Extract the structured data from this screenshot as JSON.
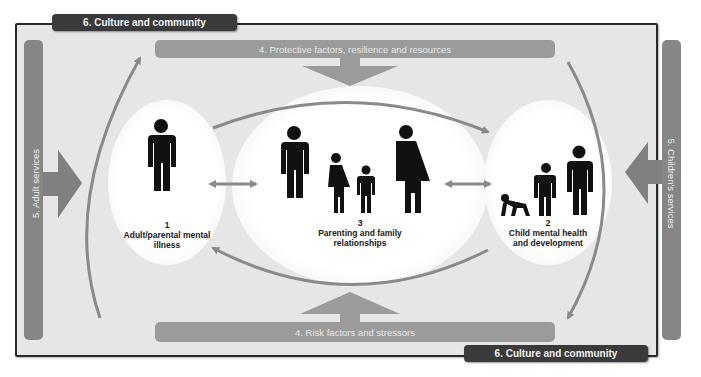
{
  "diagram": {
    "colors": {
      "frame_border": "#2a2a2a",
      "background": "#e6e6e6",
      "dark_label": "#3a3a3a",
      "bar_grey": "#9b9b9b",
      "side_bar_grey": "#868686",
      "arrow_grey": "#8a8a8a",
      "figure": "#111111"
    },
    "culture_top": {
      "label": "6. Culture and community"
    },
    "culture_bottom": {
      "label": "6. Culture and community"
    },
    "protective_bar": {
      "label": "4. Protective factors, resilience and resources",
      "arrow": "down"
    },
    "risk_bar": {
      "label": "4. Risk factors and stressors",
      "arrow": "up"
    },
    "adult_services": {
      "label": "5. Adult services",
      "arrow": "right"
    },
    "children_services": {
      "label": "5. Children's services",
      "arrow": "left"
    },
    "nodes": [
      {
        "number": "1",
        "title_line1": "Adult/parental mental",
        "title_line2": "illness",
        "icons": [
          "adult-man-icon"
        ]
      },
      {
        "number": "3",
        "title_line1": "Parenting and family",
        "title_line2": "relationships",
        "icons": [
          "man-icon",
          "girl-icon",
          "boy-icon",
          "woman-icon"
        ]
      },
      {
        "number": "2",
        "title_line1": "Child mental health",
        "title_line2": "and development",
        "icons": [
          "crawling-baby-icon",
          "child-icon",
          "teen-icon"
        ]
      }
    ],
    "connectors": [
      {
        "from": "1",
        "to": "3",
        "type": "bidirectional"
      },
      {
        "from": "3",
        "to": "2",
        "type": "bidirectional"
      },
      {
        "from": "1",
        "to": "2",
        "type": "curved-top",
        "direction": "to 2"
      },
      {
        "from": "2",
        "to": "1",
        "type": "curved-bottom",
        "direction": "to 1"
      },
      {
        "from": "left",
        "to": "top",
        "type": "outer-curve-left",
        "direction": "up"
      },
      {
        "from": "top",
        "to": "bottom",
        "type": "outer-curve-right",
        "direction": "down"
      }
    ]
  }
}
